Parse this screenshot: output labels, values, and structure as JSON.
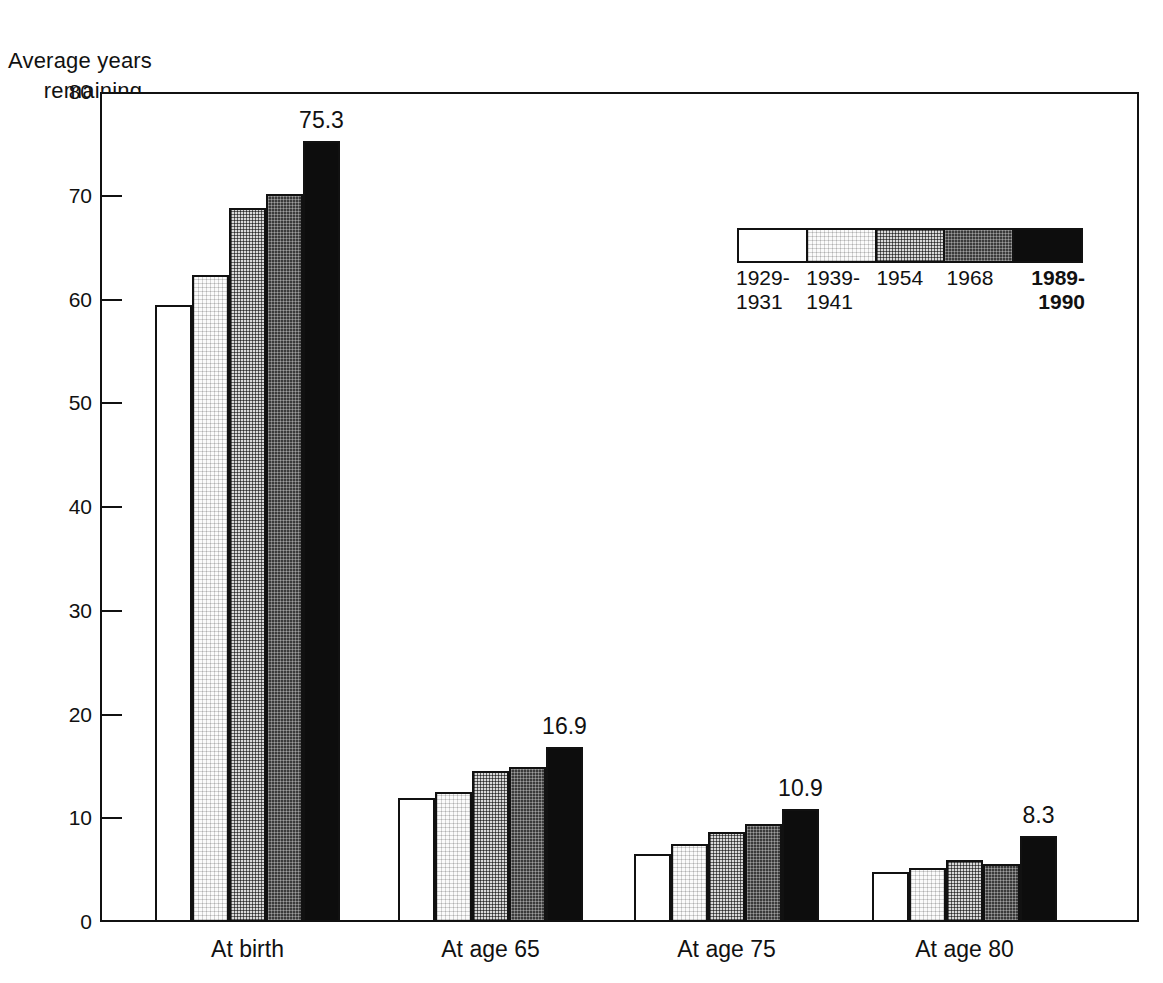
{
  "chart_data": {
    "type": "bar",
    "title": "",
    "ylabel": "Average years\nremaining",
    "xlabel": "",
    "ylim": [
      0,
      80
    ],
    "yticks": [
      0,
      10,
      20,
      30,
      40,
      50,
      60,
      70,
      80
    ],
    "ytick_labels": [
      "0",
      "10",
      "20",
      "30",
      "40",
      "50",
      "60",
      "70",
      "80"
    ],
    "grid": false,
    "legend_position": "upper right",
    "categories": [
      "At birth",
      "At age 65",
      "At age 75",
      "At age 80"
    ],
    "series": [
      {
        "name": "1929-\n1931",
        "values": [
          59.5,
          12.0,
          6.6,
          4.8
        ]
      },
      {
        "name": "1939-\n1941",
        "values": [
          62.4,
          12.5,
          7.5,
          5.2
        ]
      },
      {
        "name": "1954",
        "values": [
          68.8,
          14.6,
          8.7,
          6.0
        ]
      },
      {
        "name": "1968",
        "values": [
          70.2,
          14.9,
          9.4,
          5.6
        ]
      },
      {
        "name": "1989-\n1990",
        "values": [
          75.3,
          16.9,
          10.9,
          8.3
        ]
      }
    ],
    "annotations": [
      {
        "text": "75.3",
        "category": "At birth",
        "series": "1989-1990"
      },
      {
        "text": "16.9",
        "category": "At age 65",
        "series": "1989-1990"
      },
      {
        "text": "10.9",
        "category": "At age 75",
        "series": "1989-1990"
      },
      {
        "text": "8.3",
        "category": "At age 80",
        "series": "1989-1990"
      }
    ],
    "colors": [
      "#ffffff",
      "#fbfbfb",
      "#d9d9d9",
      "#3a3a3a",
      "#0d0d0d"
    ],
    "axis_color": "#111111"
  },
  "axis": {
    "y_title_line1": "Average years",
    "y_title_line2": "remaining",
    "ticks": [
      {
        "label": "80"
      },
      {
        "label": "70"
      },
      {
        "label": "60"
      },
      {
        "label": "50"
      },
      {
        "label": "40"
      },
      {
        "label": "30"
      },
      {
        "label": "20"
      },
      {
        "label": "10"
      },
      {
        "label": "0"
      }
    ]
  },
  "categories": [
    {
      "label": "At birth"
    },
    {
      "label": "At age 65"
    },
    {
      "label": "At age 75"
    },
    {
      "label": "At age 80"
    }
  ],
  "value_labels": [
    {
      "text": "75.3"
    },
    {
      "text": "16.9"
    },
    {
      "text": "10.9"
    },
    {
      "text": "8.3"
    }
  ],
  "legend": {
    "items": [
      {
        "label": "1929-\n1931"
      },
      {
        "label": "1939-\n1941"
      },
      {
        "label": "1954"
      },
      {
        "label": "1968"
      },
      {
        "label": "1989-\n1990"
      }
    ]
  }
}
